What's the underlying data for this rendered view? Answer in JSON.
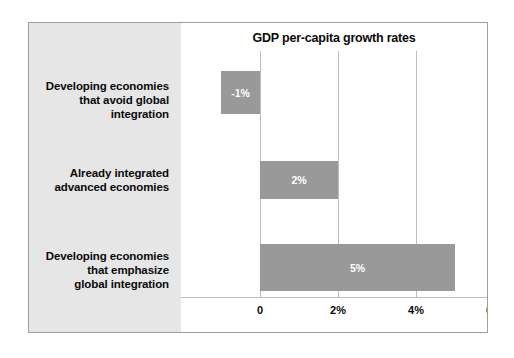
{
  "chart_data": {
    "type": "bar",
    "orientation": "horizontal",
    "title": "GDP per-capita growth rates",
    "xlabel": "",
    "ylabel": "",
    "categories": [
      "Developing economies that avoid global integration",
      "Already integrated advanced economies",
      "Developing economies that emphasize global integration"
    ],
    "category_lines": [
      [
        "Developing economies",
        "that avoid global",
        "integration"
      ],
      [
        "Already integrated",
        "advanced economies"
      ],
      [
        "Developing economies",
        "that emphasize",
        "global integration"
      ]
    ],
    "values": [
      -1,
      2,
      5
    ],
    "value_labels": [
      "-1%",
      "2%",
      "5%"
    ],
    "xlim": [
      -1.2,
      6
    ],
    "xticks": [
      0,
      2,
      4,
      6
    ],
    "xtick_labels": [
      "0",
      "2%",
      "4%",
      "6%"
    ],
    "grid": true,
    "legend": false,
    "bar_color": "#999999",
    "value_label_color": "#ffffff",
    "panel_color": "#e6e6e6",
    "gridline_color": "#bdbdbd",
    "frame_color": "#b8b8b8"
  }
}
